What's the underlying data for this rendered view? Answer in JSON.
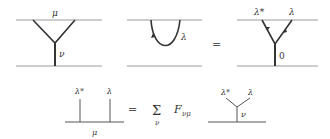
{
  "diagram": {
    "top_row": {
      "left": {
        "top_label": "μ",
        "stem_label": "ν"
      },
      "middle": {
        "curve_label": "λ"
      },
      "equals": "=",
      "right": {
        "left_label": "λ*",
        "right_label": "λ",
        "stem_label": "0"
      }
    },
    "bottom_row": {
      "left": {
        "left_label": "λ*",
        "right_label": "λ",
        "base_label": "μ"
      },
      "equals": "=",
      "sum_symbol": "Σ",
      "sum_index": "ν",
      "coefficient": "F",
      "coefficient_subscript": "νμ",
      "right": {
        "left_label": "λ*",
        "right_label": "λ",
        "stem_label": "ν"
      }
    },
    "colors": {
      "line": "#333333",
      "thin_line": "#999999"
    }
  }
}
